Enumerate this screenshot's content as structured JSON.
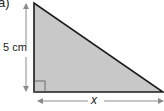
{
  "part_label": "a)",
  "triangle": {
    "fill": "#c8c8c8",
    "stroke": "#1a1a1a",
    "right_angle": "bottom-left"
  },
  "dimensions": {
    "height_label": "5 cm",
    "base_label": "x"
  },
  "arrow_color": "#8c8c8c"
}
